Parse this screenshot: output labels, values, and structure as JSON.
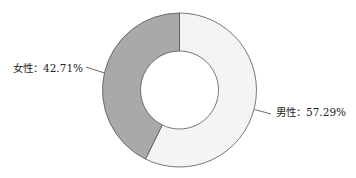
{
  "chart_data": {
    "type": "pie",
    "subtype": "donut",
    "title": "",
    "categories": [
      "男性",
      "女性"
    ],
    "values": [
      57.29,
      42.71
    ],
    "unit": "%",
    "labels": [
      "男性：57.29%",
      "女性：42.71%"
    ],
    "colors": [
      "#f4f4f4",
      "#a9a9a9"
    ],
    "start_angle_deg": 0,
    "direction": "clockwise",
    "legend": "none"
  },
  "labels": {
    "male": "男性：57.29%",
    "female": "女性：42.71%"
  },
  "style": {
    "stroke": "#555555",
    "leader": "#444444"
  }
}
